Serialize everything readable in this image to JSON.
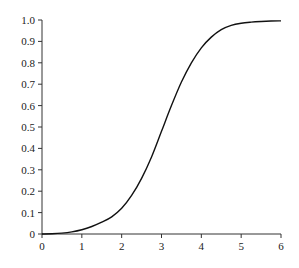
{
  "chart_data": {
    "type": "line",
    "title": "",
    "xlabel": "",
    "ylabel": "",
    "xlim": [
      0,
      6
    ],
    "ylim": [
      0,
      1.0
    ],
    "grid": false,
    "legend": null,
    "x_ticks": [
      "0",
      "1",
      "2",
      "3",
      "4",
      "5",
      "6"
    ],
    "y_ticks": [
      "0",
      "0.1",
      "0.2",
      "0.3",
      "0.4",
      "0.5",
      "0.6",
      "0.7",
      "0.8",
      "0.9",
      "1.0"
    ],
    "series": [
      {
        "name": "curve",
        "color": "#111111",
        "x": [
          0,
          0.25,
          0.5,
          0.75,
          1.0,
          1.25,
          1.5,
          1.75,
          2.0,
          2.25,
          2.5,
          2.75,
          3.0,
          3.25,
          3.5,
          3.75,
          4.0,
          4.25,
          4.5,
          4.75,
          5.0,
          5.25,
          5.5,
          5.75,
          6.0
        ],
        "y": [
          0.0,
          0.001,
          0.004,
          0.01,
          0.02,
          0.035,
          0.055,
          0.08,
          0.12,
          0.18,
          0.26,
          0.36,
          0.48,
          0.6,
          0.71,
          0.8,
          0.87,
          0.92,
          0.955,
          0.975,
          0.985,
          0.99,
          0.993,
          0.995,
          0.996
        ]
      }
    ]
  }
}
